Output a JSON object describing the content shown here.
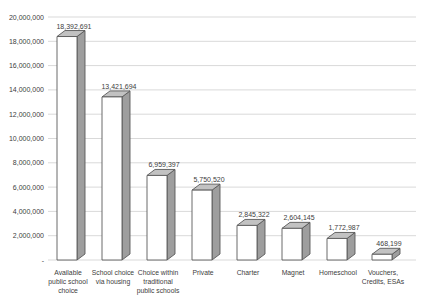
{
  "chart_data": {
    "type": "bar",
    "style": "3d-column",
    "title": "",
    "xlabel": "",
    "ylabel": "",
    "grid": true,
    "legend": "none",
    "categories": [
      "Available public school choice",
      "School choice via housing",
      "Choice within traditional public schools",
      "Private",
      "Charter",
      "Magnet",
      "Homeschool",
      "Vouchers, Credits, ESAs"
    ],
    "category_label_lines": [
      [
        "Available",
        "public school",
        "choice"
      ],
      [
        "School choice",
        "via housing"
      ],
      [
        "Choice within",
        "traditional",
        "public schools"
      ],
      [
        "Private"
      ],
      [
        "Charter"
      ],
      [
        "Magnet"
      ],
      [
        "Homeschool"
      ],
      [
        "Vouchers,",
        "Credits, ESAs"
      ]
    ],
    "values": [
      18392691,
      13421694,
      6959397,
      5750520,
      2845322,
      2604145,
      1772987,
      468199
    ],
    "data_labels": [
      "18,392,691",
      "13,421,694",
      "6,959,397",
      "5,750,520",
      "2,845,322",
      "2,604,145",
      "1,772,987",
      "468,199"
    ],
    "y_axis": {
      "min": 0,
      "max": 20000000,
      "step": 2000000,
      "tick_labels": [
        "20,000,000",
        "18,000,000",
        "16,000,000",
        "14,000,000",
        "12,000,000",
        "10,000,000",
        "8,000,000",
        "6,000,000",
        "4,000,000",
        "2,000,000",
        "-"
      ]
    },
    "colors": {
      "background": "#ffffff",
      "gridline": "#d9d9d9",
      "text": "#404040",
      "bar_front": "#ffffff",
      "bar_side": "#9e9e9e",
      "bar_top": "#c2c2c2",
      "bar_stroke": "#595959"
    }
  }
}
